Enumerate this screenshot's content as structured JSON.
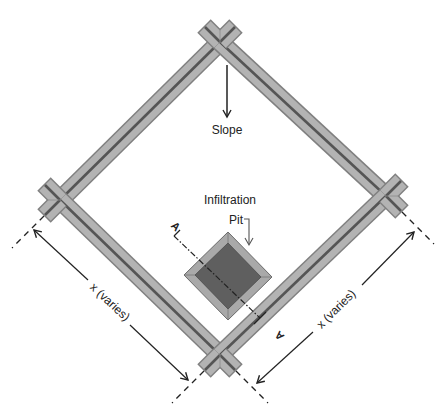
{
  "diagram": {
    "labels": {
      "slope": "Slope",
      "infiltration": "Infiltration",
      "pit": "Pit",
      "section_a_left": "A",
      "section_a_right": "A",
      "dim_left": "x (varies)",
      "dim_right": "x (varies)"
    },
    "colors": {
      "berm_fill": "#b3b3b3",
      "berm_edge": "#808080",
      "berm_centerline": "#555555",
      "pit_outer": "#a9a9a9",
      "pit_inner": "#5f5f5f",
      "lines": "#222222"
    },
    "nodes": {
      "top": [
        220,
        42
      ],
      "left": [
        60,
        200
      ],
      "right": [
        386,
        196
      ],
      "bottom": [
        220,
        355
      ]
    }
  }
}
